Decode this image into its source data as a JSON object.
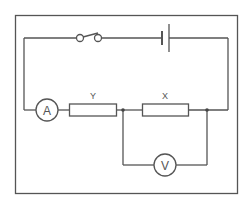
{
  "diagram": {
    "type": "circuit",
    "components": {
      "switch": {
        "label": "",
        "state": "open"
      },
      "battery": {
        "label": ""
      },
      "ammeter": {
        "symbol": "A"
      },
      "voltmeter": {
        "symbol": "V"
      },
      "resistor_y": {
        "label": "Y"
      },
      "resistor_x": {
        "label": "X"
      }
    },
    "colors": {
      "line": "#555555",
      "background": "#ffffff"
    }
  }
}
